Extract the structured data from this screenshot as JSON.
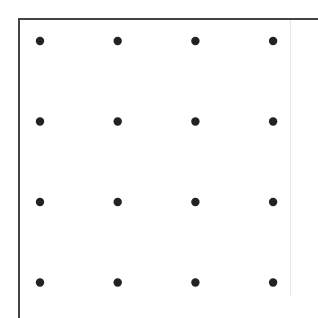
{
  "diagram": {
    "type": "dot-grid",
    "rows": 4,
    "columns": 4,
    "dot_color": "#222222",
    "border_color": "#444444",
    "background": "#ffffff"
  }
}
